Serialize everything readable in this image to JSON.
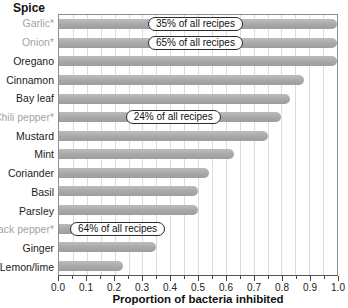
{
  "figure": {
    "y_axis_header": "Spice",
    "x_axis_label": "Proportion of bacteria inhibited"
  },
  "colors": {
    "bar": "#ababab",
    "muted_label": "#a3a3a3",
    "gridline": "#dcdcdc",
    "annotation_border": "#2b2b2b",
    "plot_border": "#8f8f8f"
  },
  "chart_data": {
    "type": "bar",
    "orientation": "horizontal",
    "title": "",
    "xlabel": "Proportion of bacteria inhibited",
    "ylabel": "Spice",
    "xlim": [
      0.0,
      1.0
    ],
    "x_tick_step": 0.1,
    "minor_tick_step": 0.05,
    "grid": "vertical gridlines every 0.05",
    "legend": "none",
    "categories": [
      "Garlic*",
      "Onion*",
      "Oregano",
      "Cinnamon",
      "Bay leaf",
      "Chili pepper*",
      "Mustard",
      "Mint",
      "Coriander",
      "Basil",
      "Parsley",
      "Black pepper*",
      "Ginger",
      "Lemon/lime"
    ],
    "values": [
      1.0,
      1.0,
      1.0,
      0.88,
      0.83,
      0.8,
      0.75,
      0.63,
      0.54,
      0.5,
      0.5,
      0.38,
      0.35,
      0.23
    ],
    "label_muted": [
      true,
      true,
      false,
      false,
      false,
      true,
      false,
      false,
      false,
      false,
      false,
      true,
      false,
      false
    ],
    "annotations": [
      {
        "category": "Garlic*",
        "label": "35% of all recipes",
        "x_frac": 0.32
      },
      {
        "category": "Onion*",
        "label": "65% of all recipes",
        "x_frac": 0.32
      },
      {
        "category": "Chili pepper*",
        "label": "24% of all recipes",
        "x_frac": 0.24
      },
      {
        "category": "Black pepper*",
        "label": "64% of all recipes",
        "x_frac": 0.04
      }
    ],
    "x_ticks": [
      "0.0",
      "0.1",
      "0.2",
      "0.3",
      "0.4",
      "0.5",
      "0.6",
      "0.7",
      "0.8",
      "0.9",
      "1.0"
    ]
  }
}
